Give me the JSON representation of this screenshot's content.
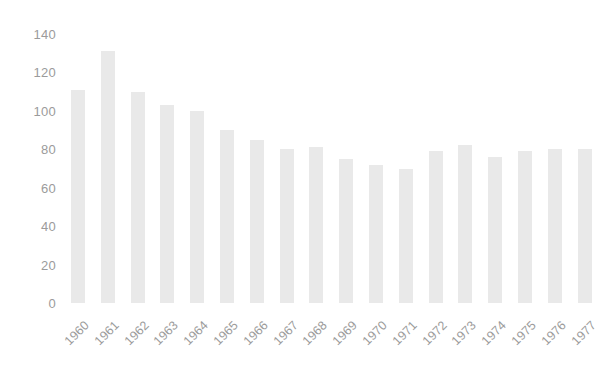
{
  "chart_data": {
    "type": "bar",
    "title": "",
    "subtitle": "",
    "xlabel": "",
    "ylabel": "",
    "categories": [
      "1960",
      "1961",
      "1962",
      "1963",
      "1964",
      "1965",
      "1966",
      "1967",
      "1968",
      "1969",
      "1970",
      "1971",
      "1972",
      "1973",
      "1974",
      "1975",
      "1976",
      "1977"
    ],
    "values": [
      111,
      131,
      110,
      103,
      100,
      90,
      85,
      80,
      81,
      75,
      72,
      70,
      79,
      82,
      76,
      79,
      80,
      80
    ],
    "series": [
      {
        "name": "",
        "values": [
          111,
          131,
          110,
          103,
          100,
          90,
          85,
          80,
          81,
          75,
          72,
          70,
          79,
          82,
          76,
          79,
          80,
          80
        ]
      }
    ],
    "ylim": [
      0,
      140
    ],
    "yticks": [
      0,
      20,
      40,
      60,
      80,
      100,
      120,
      140
    ],
    "ytick_labels": [
      "0",
      "20",
      "40",
      "60",
      "80",
      "100",
      "120",
      "140"
    ],
    "xtick_labels": [
      "1960",
      "1961",
      "1962",
      "1963",
      "1964",
      "1965",
      "1966",
      "1967",
      "1968",
      "1969",
      "1970",
      "1971",
      "1972",
      "1973",
      "1974",
      "1975",
      "1976",
      "1977"
    ],
    "xtick_rotation": -45,
    "grid": false,
    "legend": false,
    "legend_position": "none",
    "bar_color": "#e9e9e9",
    "text_color": "#9b9b9b",
    "background_color": "#ffffff"
  },
  "axes": {
    "y_tick_0": "0",
    "y_tick_1": "20",
    "y_tick_2": "40",
    "y_tick_3": "60",
    "y_tick_4": "80",
    "y_tick_5": "100",
    "y_tick_6": "120",
    "y_tick_7": "140"
  }
}
